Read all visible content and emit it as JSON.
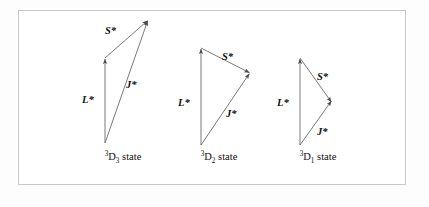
{
  "figure": {
    "background_color": "#ffffff",
    "border_color": "#c8c8c8",
    "vector_stroke_color": "#6b6b6b",
    "arrowhead_color": "#4a4a4a",
    "text_color": "#101010"
  },
  "diagrams": [
    {
      "id": "d3",
      "state_superscript": "3",
      "state_term": "D",
      "state_subscript": "3",
      "state_suffix": " state",
      "state_label_full": "3D3 state",
      "vectors": [
        {
          "name": "L*",
          "label": "L*",
          "from": [
            105,
            143
          ],
          "to": [
            105,
            58
          ]
        },
        {
          "name": "S*",
          "label": "S*",
          "from": [
            105,
            58
          ],
          "to": [
            148,
            20
          ]
        },
        {
          "name": "J*",
          "label": "J*",
          "from": [
            105,
            143
          ],
          "to": [
            148,
            20
          ]
        }
      ],
      "label_positions": {
        "L": [
          82,
          95
        ],
        "S": [
          105,
          26
        ],
        "J": [
          126,
          80
        ]
      }
    },
    {
      "id": "d2",
      "state_superscript": "3",
      "state_term": "D",
      "state_subscript": "2",
      "state_suffix": " state",
      "state_label_full": "3D2 state",
      "vectors": [
        {
          "name": "L*",
          "label": "L*",
          "from": [
            201,
            145
          ],
          "to": [
            201,
            48
          ]
        },
        {
          "name": "S*",
          "label": "S*",
          "from": [
            201,
            48
          ],
          "to": [
            250,
            73
          ]
        },
        {
          "name": "J*",
          "label": "J*",
          "from": [
            201,
            145
          ],
          "to": [
            250,
            73
          ]
        }
      ],
      "label_positions": {
        "L": [
          178,
          98
        ],
        "S": [
          222,
          52
        ],
        "J": [
          226,
          109
        ]
      }
    },
    {
      "id": "d1",
      "state_superscript": "3",
      "state_term": "D",
      "state_subscript": "1",
      "state_suffix": " state",
      "state_label_full": "3D1 state",
      "vectors": [
        {
          "name": "L*",
          "label": "L*",
          "from": [
            300,
            145
          ],
          "to": [
            300,
            58
          ]
        },
        {
          "name": "S*",
          "label": "S*",
          "from": [
            300,
            58
          ],
          "to": [
            332,
            103
          ]
        },
        {
          "name": "J*",
          "label": "J*",
          "from": [
            300,
            145
          ],
          "to": [
            332,
            100
          ]
        }
      ],
      "label_positions": {
        "L": [
          277,
          98
        ],
        "S": [
          317,
          72
        ],
        "J": [
          317,
          127
        ]
      }
    }
  ],
  "state_labels": [
    {
      "id": "d3",
      "x": 88,
      "y": 152,
      "width": 70
    },
    {
      "id": "d2",
      "x": 184,
      "y": 152,
      "width": 70
    },
    {
      "id": "d1",
      "x": 283,
      "y": 152,
      "width": 70
    }
  ]
}
